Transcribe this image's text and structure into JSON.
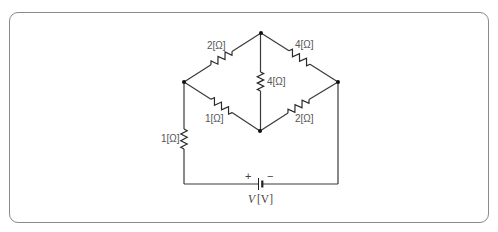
{
  "diagram": {
    "type": "bridge-circuit",
    "resistors": [
      {
        "id": "R_top_left",
        "label": "2[Ω]",
        "value_ohm": 2,
        "between": [
          "left",
          "top"
        ]
      },
      {
        "id": "R_top_right",
        "label": "4[Ω]",
        "value_ohm": 4,
        "between": [
          "top",
          "right"
        ]
      },
      {
        "id": "R_middle",
        "label": "4[Ω]",
        "value_ohm": 4,
        "between": [
          "top",
          "bottom"
        ]
      },
      {
        "id": "R_bottom_left",
        "label": "1[Ω]",
        "value_ohm": 1,
        "between": [
          "left",
          "bottom"
        ]
      },
      {
        "id": "R_bottom_right",
        "label": "2[Ω]",
        "value_ohm": 2,
        "between": [
          "bottom",
          "right"
        ]
      },
      {
        "id": "R_series",
        "label": "1[Ω]",
        "value_ohm": 1,
        "between": [
          "left",
          "battery_plus"
        ]
      }
    ],
    "source": {
      "label_symbol": "V",
      "label_unit": "[V]",
      "plus": "+",
      "minus": "−"
    },
    "nodes": [
      "top",
      "left",
      "right",
      "bottom"
    ]
  }
}
